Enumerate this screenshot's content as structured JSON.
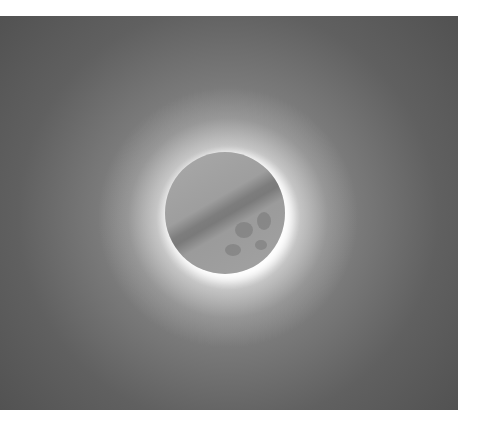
{
  "image": {
    "subject": "lunar eclipse",
    "description": "Grayscale photograph of the moon with earth's shadow band and bright glow around the lower-right limb",
    "colors": {
      "background_dark": "#4f4f4f",
      "background_mid": "#7a7a7a",
      "glow": "#ffffff",
      "moon_surface": "#a5a5a5",
      "shadow_band": "#7b7b7b"
    }
  }
}
